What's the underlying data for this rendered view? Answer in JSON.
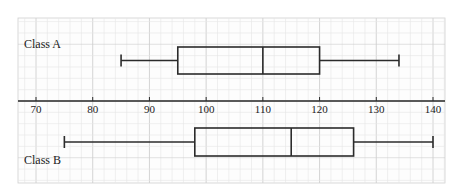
{
  "chart_data": {
    "type": "boxplot",
    "title": "",
    "xlabel": "",
    "ylabel": "",
    "xlim": [
      67,
      141
    ],
    "x_ticks": [
      70,
      80,
      90,
      100,
      110,
      120,
      130,
      140
    ],
    "grid": true,
    "series": [
      {
        "name": "Class A",
        "min": 85,
        "q1": 95,
        "median": 110,
        "q3": 120,
        "max": 134
      },
      {
        "name": "Class B",
        "min": 75,
        "q1": 98,
        "median": 115,
        "q3": 126,
        "max": 140
      }
    ]
  },
  "labels": {
    "class_a": "Class A",
    "class_b": "Class B"
  },
  "colors": {
    "grid_minor": "#e6e6e6",
    "grid_major": "#cfcfcf",
    "line": "#2b2b2b",
    "background": "#ffffff"
  }
}
